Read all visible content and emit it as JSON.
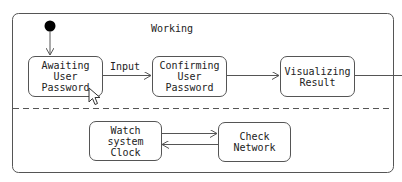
{
  "composite_state": {
    "name": "Working"
  },
  "states": {
    "awaiting": "Awaiting\nUser Password",
    "confirming": "Confirming\nUser Password",
    "visualizing": "Visualizing\nResult",
    "watch": "Watch\nsystem Clock",
    "check": "Check\nNetwork"
  },
  "transitions": [
    {
      "from": "initial",
      "to": "Awaiting User Password",
      "label": ""
    },
    {
      "from": "Awaiting User Password",
      "to": "Confirming User Password",
      "label": "Input"
    },
    {
      "from": "Confirming User Password",
      "to": "Visualizing Result",
      "label": ""
    },
    {
      "from": "Visualizing Result",
      "to": "exit",
      "label": ""
    },
    {
      "from": "Watch system Clock",
      "to": "Check Network",
      "label": ""
    },
    {
      "from": "Check Network",
      "to": "Watch system Clock",
      "label": ""
    }
  ],
  "transition_label_input": "Input",
  "colors": {
    "stroke": "#555555",
    "text": "#222222",
    "background": "#ffffff"
  }
}
